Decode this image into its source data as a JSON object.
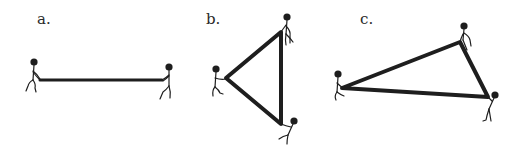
{
  "figure": {
    "panels": [
      {
        "label": "a.",
        "shape": "line",
        "people": 2,
        "label_pos": [
          37,
          13
        ]
      },
      {
        "label": "b.",
        "shape": "triangle",
        "people": 3,
        "label_pos": [
          206,
          13
        ]
      },
      {
        "label": "c.",
        "shape": "triangle",
        "people": 3,
        "label_pos": [
          360,
          13
        ]
      }
    ],
    "colors": {
      "ink": "#1e1e1e",
      "background": "#ffffff"
    }
  }
}
